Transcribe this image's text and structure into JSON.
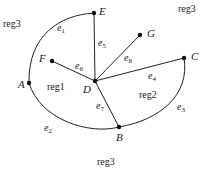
{
  "diagram": {
    "type": "planar-graph",
    "vertices": [
      {
        "id": "A",
        "label": "A",
        "x": 29,
        "y": 83,
        "lx": 18,
        "ly": 88
      },
      {
        "id": "B",
        "label": "B",
        "x": 119,
        "y": 127,
        "lx": 116,
        "ly": 141
      },
      {
        "id": "C",
        "label": "C",
        "x": 184,
        "y": 58,
        "lx": 191,
        "ly": 60
      },
      {
        "id": "D",
        "label": "D",
        "x": 95,
        "y": 81,
        "lx": 83,
        "ly": 93
      },
      {
        "id": "E",
        "label": "E",
        "x": 94,
        "y": 13,
        "lx": 99,
        "ly": 15
      },
      {
        "id": "F",
        "label": "F",
        "x": 52,
        "y": 61,
        "lx": 39,
        "ly": 62
      },
      {
        "id": "G",
        "label": "G",
        "x": 140,
        "y": 35,
        "lx": 147,
        "ly": 37
      }
    ],
    "edges": [
      {
        "id": "e1",
        "base": "e",
        "sub": "1",
        "from": "E",
        "to": "A",
        "path": "M94,13 C60,15 28,35 29,83",
        "lx": 57,
        "ly": 31
      },
      {
        "id": "e2",
        "base": "e",
        "sub": "2",
        "from": "A",
        "to": "B",
        "path": "M29,83 C40,120 90,135 119,127",
        "lx": 44,
        "ly": 131
      },
      {
        "id": "e3",
        "base": "e",
        "sub": "3",
        "from": "C",
        "to": "B",
        "path": "M184,58 C190,95 160,120 119,127",
        "lx": 177,
        "ly": 110
      },
      {
        "id": "e4",
        "base": "e",
        "sub": "4",
        "from": "D",
        "to": "C",
        "path": "M95,81 L184,58",
        "lx": 148,
        "ly": 79
      },
      {
        "id": "e5",
        "base": "e",
        "sub": "5",
        "from": "E",
        "to": "D",
        "path": "M94,13 L95,81",
        "lx": 98,
        "ly": 46
      },
      {
        "id": "e6",
        "base": "e",
        "sub": "6",
        "from": "F",
        "to": "D",
        "path": "M52,61 L95,81",
        "lx": 75,
        "ly": 69
      },
      {
        "id": "e7",
        "base": "e",
        "sub": "7",
        "from": "D",
        "to": "B",
        "path": "M95,81 L119,127",
        "lx": 96,
        "ly": 109
      },
      {
        "id": "e8",
        "base": "e",
        "sub": "8",
        "from": "D",
        "to": "G",
        "path": "M95,81 L140,35",
        "lx": 124,
        "ly": 61
      }
    ],
    "regions": [
      {
        "id": "reg1",
        "label": "reg1",
        "x": 47,
        "y": 90
      },
      {
        "id": "reg2",
        "label": "reg2",
        "x": 139,
        "y": 98
      },
      {
        "id": "reg3-top-left",
        "label": "reg3",
        "x": 3,
        "y": 27
      },
      {
        "id": "reg3-top-right",
        "label": "reg3",
        "x": 178,
        "y": 12
      },
      {
        "id": "reg3-bottom",
        "label": "reg3",
        "x": 97,
        "y": 165
      }
    ]
  }
}
